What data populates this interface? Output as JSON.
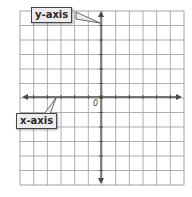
{
  "diagram": {
    "type": "coordinate-plane",
    "grid": {
      "columns": 12,
      "rows": 12,
      "left": 20,
      "top": 11,
      "right": 184,
      "bottom": 185,
      "line_color": "#9a9a9a",
      "border_color": "#8a8a8a"
    },
    "origin": {
      "x": 101,
      "y": 97,
      "label": "0"
    },
    "axes": {
      "color": "#4a4a4a",
      "x_axis": {
        "label": "x-axis"
      },
      "y_axis": {
        "label": "y-axis"
      }
    }
  }
}
